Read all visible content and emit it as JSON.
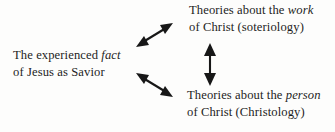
{
  "diagram": {
    "title_text": "",
    "background_color": "#fdfdfc",
    "text_color": "#1d1d1d",
    "arrow_color": "#171717",
    "nodes": [
      {
        "id": "fact",
        "line1_pre": "The experienced ",
        "line1_em": "fact",
        "line1_post": "",
        "line2": "of Jesus as Savior"
      },
      {
        "id": "work",
        "line1_pre": "Theories about the ",
        "line1_em": "work",
        "line1_post": "",
        "line2": "of Christ (soteriology)"
      },
      {
        "id": "person",
        "line1_pre": "Theories about the ",
        "line1_em": "person",
        "line1_post": "",
        "line2": "of Christ (Christology)"
      }
    ],
    "arrows": [
      {
        "id": "fact-to-work",
        "kind": "double-headed-diagonal-up-right"
      },
      {
        "id": "fact-to-person",
        "kind": "double-headed-diagonal-down-right"
      },
      {
        "id": "work-to-person",
        "kind": "double-headed-vertical"
      }
    ]
  }
}
